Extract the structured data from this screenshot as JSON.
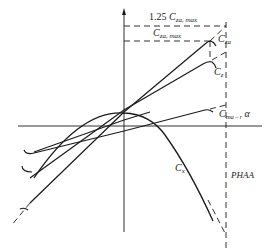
{
  "diagram": {
    "title": "",
    "labels": {
      "cza_125": {
        "prefix": "1.25 ",
        "main": "C",
        "sub": "za, max"
      },
      "cza_max": {
        "main": "C",
        "sub": "za, max"
      },
      "cza": {
        "main": "C",
        "sub": "za"
      },
      "cz": {
        "main": "C",
        "sub": "z"
      },
      "cm": {
        "main": "C",
        "sub": "m",
        "subsub": "a – r",
        "suffix": " α"
      },
      "cx": {
        "main": "C",
        "sub": "x"
      },
      "phaa": "PHAA"
    },
    "curves": [
      {
        "name": "C_za",
        "type": "line",
        "style": "solid",
        "end_marker": "hook"
      },
      {
        "name": "C_z",
        "type": "line",
        "style": "solid",
        "end_marker": "hook"
      },
      {
        "name": "C_m",
        "type": "line",
        "style": "solid",
        "end_marker": "hook"
      },
      {
        "name": "C_x",
        "type": "parabola",
        "style": "solid"
      }
    ],
    "reference_lines": [
      {
        "name": "1.25 C_za,max",
        "style": "dashed",
        "orientation": "horizontal"
      },
      {
        "name": "C_za,max",
        "style": "dashed",
        "orientation": "horizontal"
      },
      {
        "name": "PHAA",
        "style": "dashed",
        "orientation": "vertical"
      }
    ],
    "colors": {
      "line": "#1a1a1a",
      "background": "#ffffff"
    }
  }
}
